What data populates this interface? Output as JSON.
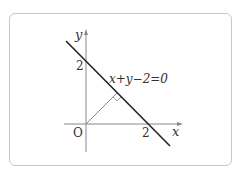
{
  "diagram": {
    "axes": {
      "x_label": "x",
      "y_label": "y",
      "origin_label": "O"
    },
    "ticks": {
      "x_intercept": "2",
      "y_intercept": "2"
    },
    "line": {
      "equation": "x+y−2=0"
    },
    "perpendicular": {
      "from": "O",
      "right_angle_marker": true
    },
    "colors": {
      "axis": "#888888",
      "line": "#222222",
      "frame": "#c8c8c8"
    }
  }
}
